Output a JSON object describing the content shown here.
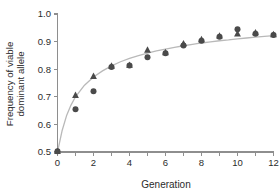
{
  "chart_data": {
    "type": "scatter",
    "title": "",
    "xlabel": "Generation",
    "ylabel": "Frequency of viable dominant allele",
    "ylabel_line1": "Frequency of viable",
    "ylabel_line2": "dominant allele",
    "xlim": [
      0,
      12
    ],
    "ylim": [
      0.5,
      1.0
    ],
    "xticks": [
      0,
      1,
      2,
      3,
      4,
      5,
      6,
      7,
      8,
      9,
      10,
      11,
      12
    ],
    "xtick_labels": [
      "0",
      "",
      "2",
      "",
      "4",
      "",
      "6",
      "",
      "8",
      "",
      "10",
      "",
      "12"
    ],
    "yticks": [
      0.5,
      0.6,
      0.7,
      0.8,
      0.9,
      1.0
    ],
    "ytick_labels": [
      "0.5",
      "0.6",
      "0.7",
      "0.8",
      "0.9",
      "1.0"
    ],
    "grid": false,
    "legend": "none",
    "marker_color": "#4a4a4a",
    "curve_color": "#b9b9b9",
    "axis_color": "#8e8e8e",
    "x": [
      0,
      1,
      2,
      3,
      4,
      5,
      6,
      7,
      8,
      9,
      10,
      11,
      12
    ],
    "series": [
      {
        "name": "replicate-circles",
        "marker": "circle",
        "values": [
          0.503,
          0.655,
          0.72,
          0.808,
          0.813,
          0.843,
          0.858,
          0.886,
          0.903,
          0.918,
          0.945,
          0.928,
          0.924
        ]
      },
      {
        "name": "replicate-triangles",
        "marker": "triangle",
        "values": [
          0.503,
          0.706,
          0.775,
          0.812,
          0.815,
          0.87,
          0.861,
          0.893,
          0.908,
          0.921,
          0.929,
          0.933,
          0.926
        ]
      }
    ],
    "fit_curve": {
      "name": "fitted-model-curve",
      "x": [
        0,
        0.25,
        0.5,
        0.75,
        1,
        1.5,
        2,
        2.5,
        3,
        3.5,
        4,
        4.5,
        5,
        5.5,
        6,
        6.5,
        7,
        7.5,
        8,
        8.5,
        9,
        9.5,
        10,
        10.5,
        11,
        11.5,
        12
      ],
      "y": [
        0.5,
        0.576,
        0.631,
        0.67,
        0.7,
        0.742,
        0.772,
        0.794,
        0.812,
        0.827,
        0.839,
        0.849,
        0.858,
        0.866,
        0.873,
        0.879,
        0.885,
        0.89,
        0.895,
        0.899,
        0.903,
        0.906,
        0.91,
        0.913,
        0.916,
        0.919,
        0.922
      ]
    }
  }
}
